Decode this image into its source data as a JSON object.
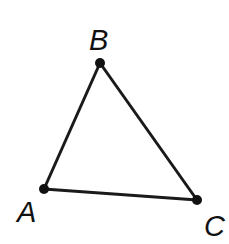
{
  "figure": {
    "kind": "geometry-diagram",
    "shape": "triangle",
    "background_color": "#ffffff",
    "stroke_color": "#1a1a1a",
    "label_color": "#111111",
    "stroke_width": 3,
    "vertex_dot_radius": 5,
    "width": 229,
    "height": 244
  },
  "vertices": [
    {
      "id": "A",
      "label": "A",
      "x": 44,
      "y": 189,
      "label_x": 17,
      "label_y": 198
    },
    {
      "id": "B",
      "label": "B",
      "x": 100,
      "y": 63,
      "label_x": 89,
      "label_y": 26
    },
    {
      "id": "C",
      "label": "C",
      "x": 197,
      "y": 200,
      "label_x": 204,
      "label_y": 212
    }
  ],
  "edges": [
    {
      "id": "AB",
      "from": "A",
      "to": "B"
    },
    {
      "id": "BC",
      "from": "B",
      "to": "C"
    },
    {
      "id": "AC",
      "from": "A",
      "to": "C"
    }
  ]
}
